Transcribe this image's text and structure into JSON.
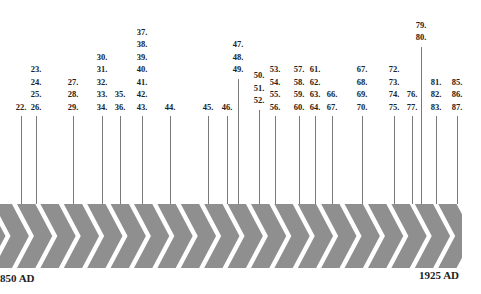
{
  "timeline": {
    "start_label": "850 AD",
    "end_label": "1925 AD",
    "band_color": "#8f8f8f",
    "line_color": "#7a7a7a",
    "columns": [
      {
        "x": 21,
        "labels": [
          "22."
        ]
      },
      {
        "x": 36,
        "labels": [
          "23.",
          "24.",
          "25.",
          "26."
        ]
      },
      {
        "x": 73,
        "labels": [
          "27.",
          "28.",
          "29."
        ]
      },
      {
        "x": 102,
        "labels": [
          "30.",
          "31.",
          "32.",
          "33.",
          "34."
        ]
      },
      {
        "x": 120,
        "labels": [
          "35.",
          "36."
        ]
      },
      {
        "x": 142,
        "labels": [
          "37.",
          "38.",
          "39.",
          "40.",
          "41.",
          "42.",
          "43."
        ]
      },
      {
        "x": 170,
        "labels": [
          "44."
        ]
      },
      {
        "x": 208,
        "labels": [
          "45."
        ]
      },
      {
        "x": 227,
        "labels": [
          "46."
        ]
      },
      {
        "x": 238,
        "labels": [
          "47.",
          "48.",
          "49."
        ]
      },
      {
        "x": 259,
        "labels": [
          "50.",
          "51.",
          "52."
        ]
      },
      {
        "x": 275,
        "labels": [
          "53.",
          "54.",
          "55.",
          "56."
        ]
      },
      {
        "x": 299,
        "labels": [
          "57.",
          "58.",
          "59.",
          "60."
        ]
      },
      {
        "x": 315,
        "labels": [
          "61.",
          "62.",
          "63.",
          "64."
        ]
      },
      {
        "x": 332,
        "labels": [
          "66.",
          "67."
        ]
      },
      {
        "x": 362,
        "labels": [
          "67.",
          "68.",
          "69.",
          "70."
        ]
      },
      {
        "x": 394,
        "labels": [
          "72.",
          "73.",
          "74.",
          "75."
        ]
      },
      {
        "x": 412,
        "labels": [
          "76.",
          "77."
        ]
      },
      {
        "x": 421,
        "labels": [
          "79.",
          "80."
        ]
      },
      {
        "x": 436,
        "labels": [
          "81.",
          "82.",
          "83."
        ]
      },
      {
        "x": 457,
        "labels": [
          "85.",
          "86.",
          "87."
        ]
      }
    ]
  }
}
